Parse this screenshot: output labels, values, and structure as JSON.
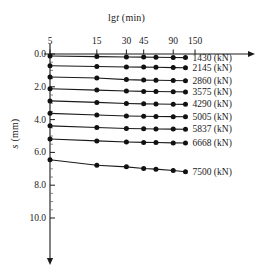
{
  "chart_data": {
    "type": "line",
    "title": "",
    "xlabel": "lgt (min)",
    "xlabel_prefix": "lg",
    "xlabel_italic": "t",
    "xlabel_suffix": " (min)",
    "ylabel": "s (mm)",
    "ylabel_italic": "s",
    "ylabel_suffix": " (mm)",
    "xscale": "log",
    "x_ticks": [
      5,
      15,
      30,
      45,
      90,
      150
    ],
    "x_tick_labels": [
      "5",
      "15",
      "30",
      "45",
      "90",
      "150"
    ],
    "y_ticks": [
      0.0,
      2.0,
      4.0,
      6.0,
      8.0,
      10.0
    ],
    "y_tick_labels": [
      "0.0",
      "2.0",
      "4.0",
      "6.0",
      "8.0",
      "10.0"
    ],
    "y_minor_ticks": [
      0.5,
      1.0,
      1.5,
      2.5,
      3.0,
      3.5,
      4.5,
      5.0,
      5.5,
      6.5,
      7.0,
      7.5,
      8.5,
      9.0,
      9.5
    ],
    "ylim": [
      0.0,
      11.6
    ],
    "xlim": [
      4.2,
      185
    ],
    "y_axis_inverted": true,
    "grid": false,
    "legend_position": "right-inline",
    "x_values": [
      5,
      15,
      30,
      45,
      60,
      90,
      120
    ],
    "series": [
      {
        "name": "1430 (kN)",
        "label": "1430 (kN)",
        "values": [
          0.12,
          0.16,
          0.18,
          0.19,
          0.2,
          0.21,
          0.22
        ]
      },
      {
        "name": "2145 (kN)",
        "label": "2145 (kN)",
        "values": [
          0.72,
          0.76,
          0.79,
          0.8,
          0.81,
          0.83,
          0.84
        ]
      },
      {
        "name": "2860 (kN)",
        "label": "2860 (kN)",
        "values": [
          1.4,
          1.46,
          1.56,
          1.59,
          1.6,
          1.62,
          1.63
        ]
      },
      {
        "name": "3575 (kN)",
        "label": "3575 (kN)",
        "values": [
          2.12,
          2.2,
          2.26,
          2.28,
          2.29,
          2.3,
          2.31
        ]
      },
      {
        "name": "4290 (kN)",
        "label": "4290 (kN)",
        "values": [
          2.86,
          2.95,
          3.02,
          3.04,
          3.05,
          3.06,
          3.07
        ]
      },
      {
        "name": "5005 (kN)",
        "label": "5005 (kN)",
        "values": [
          3.62,
          3.72,
          3.78,
          3.8,
          3.81,
          3.82,
          3.83
        ]
      },
      {
        "name": "5837 (kN)",
        "label": "5837 (kN)",
        "values": [
          4.38,
          4.48,
          4.54,
          4.56,
          4.57,
          4.58,
          4.59
        ]
      },
      {
        "name": "6668 (kN)",
        "label": "6668 (kN)",
        "values": [
          5.18,
          5.3,
          5.37,
          5.39,
          5.4,
          5.42,
          5.43
        ]
      },
      {
        "name": "7500 (kN)",
        "label": "7500 (kN)",
        "values": [
          6.45,
          6.78,
          6.88,
          6.98,
          7.02,
          7.1,
          7.18
        ]
      }
    ]
  }
}
